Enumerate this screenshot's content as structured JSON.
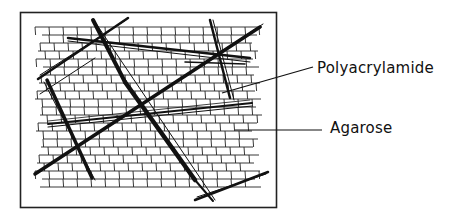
{
  "diagram": {
    "frame": {
      "x": 20,
      "y": 12,
      "width": 257,
      "height": 196
    },
    "labels": [
      {
        "id": "polyacrylamide",
        "text": "Polyacrylamide"
      },
      {
        "id": "agarose",
        "text": "Agarose"
      }
    ],
    "colors": {
      "ink": "#111111",
      "background": "#ffffff"
    }
  }
}
